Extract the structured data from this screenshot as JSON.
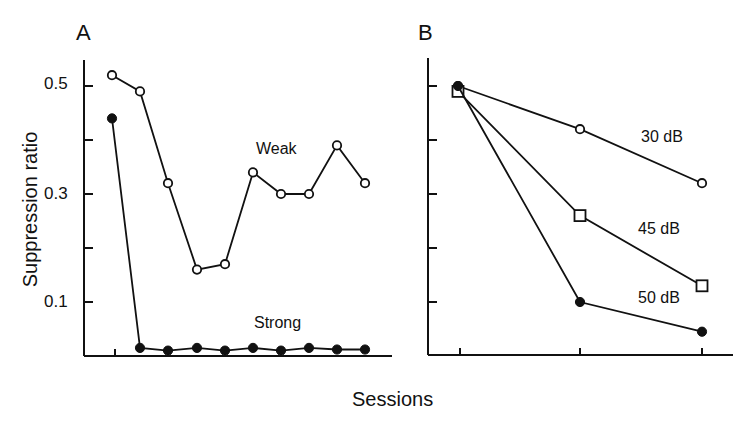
{
  "figure": {
    "xlabel": "Sessions",
    "ylabel": "Suppression ratio"
  },
  "chart_data": [
    {
      "panel": "A",
      "type": "line",
      "title": "A",
      "xlabel": "Sessions",
      "ylabel": "Suppression ratio",
      "ylim": [
        0.0,
        0.55
      ],
      "yticks": [
        0.1,
        0.2,
        0.3,
        0.4,
        0.5
      ],
      "ytick_labels": [
        "0.1",
        "",
        "0.3",
        "",
        "0.5"
      ],
      "grid": false,
      "x": [
        1,
        2,
        3,
        4,
        5,
        6,
        7,
        8,
        9,
        10
      ],
      "series": [
        {
          "name": "Weak",
          "marker": "open-circle",
          "values": [
            0.52,
            0.49,
            0.32,
            0.16,
            0.17,
            0.34,
            0.3,
            0.3,
            0.39,
            0.32
          ]
        },
        {
          "name": "Strong",
          "marker": "filled-circle",
          "values": [
            0.44,
            0.015,
            0.01,
            0.015,
            0.01,
            0.015,
            0.01,
            0.015,
            0.012,
            0.012
          ]
        }
      ]
    },
    {
      "panel": "B",
      "type": "line",
      "title": "B",
      "xlabel": "Sessions",
      "ylabel": "Suppression ratio",
      "ylim": [
        0.0,
        0.55
      ],
      "yticks": [
        0.1,
        0.2,
        0.3,
        0.4,
        0.5
      ],
      "ytick_labels": [
        "",
        "",
        "",
        "",
        ""
      ],
      "grid": false,
      "x": [
        1,
        2,
        3
      ],
      "series": [
        {
          "name": "30 dB",
          "marker": "open-circle",
          "values": [
            0.5,
            0.42,
            0.32
          ]
        },
        {
          "name": "45 dB",
          "marker": "open-square",
          "values": [
            0.49,
            0.26,
            0.13
          ]
        },
        {
          "name": "50 dB",
          "marker": "filled-circle",
          "values": [
            0.5,
            0.1,
            0.045
          ]
        }
      ]
    }
  ],
  "labels": {
    "panel_a": "A",
    "panel_b": "B",
    "tick_05": "0.5",
    "tick_03": "0.3",
    "tick_01": "0.1",
    "weak": "Weak",
    "strong": "Strong",
    "db30": "30 dB",
    "db45": "45 dB",
    "db50": "50 dB"
  }
}
